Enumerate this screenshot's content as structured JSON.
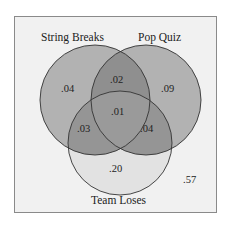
{
  "diagram": {
    "type": "venn3",
    "sets": [
      {
        "name": "String Breaks"
      },
      {
        "name": "Pop Quiz"
      },
      {
        "name": "Team Loses"
      }
    ],
    "regions": {
      "string_only": ".04",
      "quiz_only": ".09",
      "team_only": ".20",
      "string_quiz": ".02",
      "string_team": ".03",
      "quiz_team": ".04",
      "all_three": ".01",
      "outside": ".57"
    },
    "colors": {
      "background": "#f1f1f1",
      "circle_fill": "#a9a9a9",
      "team_fill": "#e1e1e1",
      "stroke": "#333333",
      "frame": "#8a8a8a"
    }
  }
}
